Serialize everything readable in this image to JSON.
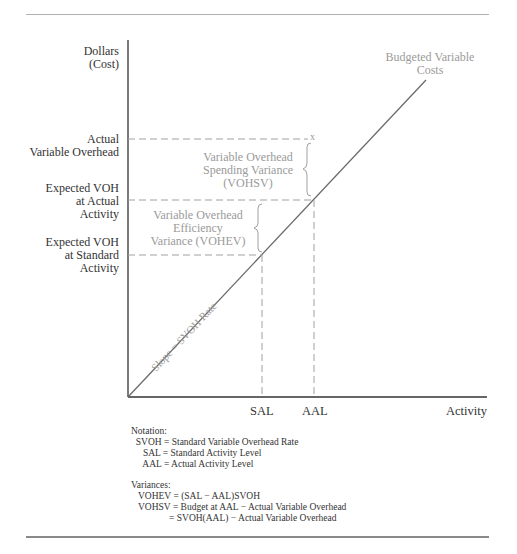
{
  "figure": {
    "y_axis": {
      "title_line1": "Dollars",
      "title_line2": "(Cost)",
      "labels": [
        {
          "line1": "Actual",
          "line2": "Variable Overhead"
        },
        {
          "line1": "Expected VOH",
          "line2": "at Actual",
          "line3": "Activity"
        },
        {
          "line1": "Expected VOH",
          "line2": "at Standard",
          "line3": "Activity"
        }
      ]
    },
    "x_axis": {
      "title": "Activity",
      "labels": [
        "SAL",
        "AAL"
      ]
    },
    "line_label_line1": "Budgeted Variable",
    "line_label_line2": "Costs",
    "slope_label": "Slope = SVOH Rate",
    "actual_point_marker": "x",
    "spending_variance": {
      "line1": "Variable Overhead",
      "line2": "Spending Variance",
      "line3": "(VOHSV)"
    },
    "efficiency_variance": {
      "line1": "Variable Overhead",
      "line2": "Efficiency",
      "line3": "Variance (VOHEV)"
    }
  },
  "notation": {
    "heading": "Notation:",
    "rows": [
      "  SVOH = Standard Variable Overhead Rate",
      "     SAL = Standard Activity Level",
      "     AAL = Actual Activity Level"
    ]
  },
  "variances": {
    "heading": "Variances:",
    "rows": [
      "   VOHEV = (SAL − AAL)SVOH",
      "   VOHSV = Budget at AAL − Actual Variable Overhead",
      "                = SVOH(AAL) − Actual Variable Overhead"
    ]
  },
  "colors": {
    "axis": "#333333",
    "line": "#6a6a6a",
    "dashed": "#a0a0a0",
    "annotation_text": "#9a9a9a"
  }
}
